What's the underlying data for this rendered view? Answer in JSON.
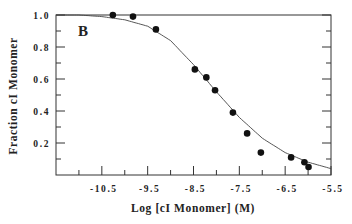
{
  "chart_data": {
    "type": "scatter",
    "panel_label": "B",
    "title": "",
    "xlabel": "Log [cI Monomer] (M)",
    "ylabel": "Fraction cI Monomer",
    "xlim": [
      -11.5,
      -5.5
    ],
    "ylim": [
      0.0,
      1.0
    ],
    "x_major_ticks": [
      -10.5,
      -9.5,
      -8.5,
      -7.5,
      -6.5,
      -5.5
    ],
    "x_tick_labels": [
      "-10.5",
      "-9.5",
      "-8.5",
      "-7.5",
      "-6.5",
      "-5.5"
    ],
    "x_minor_ticks": [
      -11.0,
      -10.0,
      -9.0,
      -8.0,
      -7.0,
      -6.0
    ],
    "y_major_ticks": [
      0.2,
      0.4,
      0.6,
      0.8,
      1.0
    ],
    "y_tick_labels": [
      "0.2",
      "0.4",
      "0.6",
      "0.8",
      "1.0"
    ],
    "y_minor_ticks": [
      0.1,
      0.3,
      0.5,
      0.7,
      0.9
    ],
    "grid": false,
    "series": [
      {
        "name": "data",
        "mark": "filled-circle",
        "x": [
          -10.26,
          -9.82,
          -9.32,
          -8.47,
          -8.22,
          -8.03,
          -7.64,
          -7.33,
          -7.03,
          -6.37,
          -6.08,
          -5.99
        ],
        "y": [
          1.0,
          0.99,
          0.91,
          0.66,
          0.61,
          0.53,
          0.39,
          0.26,
          0.14,
          0.11,
          0.08,
          0.05
        ]
      },
      {
        "name": "fit",
        "mark": "line",
        "model": "monomer-dimer sigmoid",
        "midpoint_log": -7.9,
        "x": [
          -11.5,
          -11.0,
          -10.5,
          -10.0,
          -9.5,
          -9.0,
          -8.5,
          -8.0,
          -7.5,
          -7.0,
          -6.5,
          -6.0,
          -5.5
        ],
        "y": [
          1.0,
          1.0,
          0.99,
          0.97,
          0.93,
          0.84,
          0.69,
          0.52,
          0.36,
          0.23,
          0.14,
          0.08,
          0.04
        ]
      }
    ]
  }
}
